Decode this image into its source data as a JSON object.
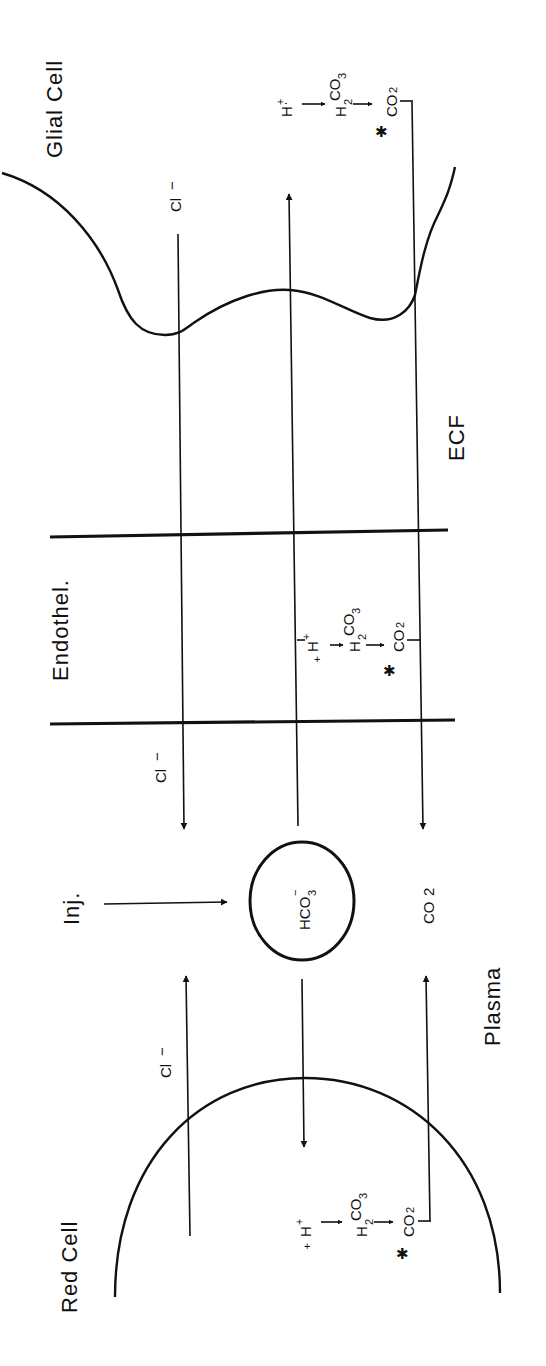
{
  "diagram": {
    "orientation": "rotated 90deg counter-clockwise",
    "compartments": {
      "glial_cell": "Glial Cell",
      "ecf": "ECF",
      "endothelium": "Endothel.",
      "plasma": "Plasma",
      "red_cell": "Red Cell"
    },
    "injection_label": "Inj.",
    "pool": {
      "label": "HCO",
      "sub": "3",
      "sup": "−"
    },
    "ions": {
      "chloride": "Cl",
      "chloride_sup": "−",
      "co2": "CO",
      "co2_sub": "2"
    },
    "reaction": {
      "h_plus": "H",
      "h_plus_sup": "+",
      "carbonic_acid": "H",
      "carbonic_acid_sub": "2",
      "carbonic_acid_rest": "CO",
      "carbonic_acid_sub2": "3",
      "co2": "CO",
      "co2_sub": "2",
      "enzyme_marker": "✱"
    },
    "colors": {
      "ink": "#111111",
      "paper": "#ffffff"
    }
  }
}
